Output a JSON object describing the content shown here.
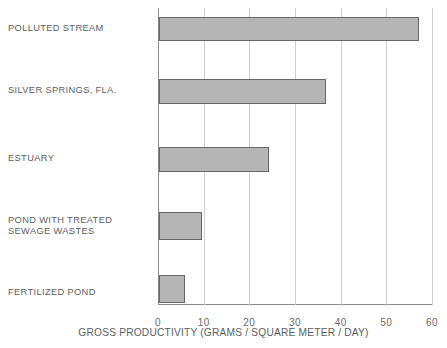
{
  "chart_data": {
    "type": "bar",
    "orientation": "horizontal",
    "title": "",
    "subtitle": "",
    "xlabel": "GROSS PRODUCTIVITY (GRAMS / SQUARE METER / DAY)",
    "ylabel": "",
    "xlim": [
      0,
      60
    ],
    "xticks": [
      0,
      10,
      20,
      30,
      40,
      50,
      60
    ],
    "xtick_labels": [
      "0",
      "10",
      "20",
      "30",
      "40",
      "50",
      "60"
    ],
    "grid": "vertical",
    "legend": "none",
    "categories": [
      "POLLUTED STREAM",
      "SILVER SPRINGS, FLA.",
      "ESTUARY",
      "POND WITH TREATED\nSEWAGE WASTES",
      "FERTILIZED POND"
    ],
    "values": [
      57,
      36.5,
      24,
      9.5,
      5.7
    ],
    "bar_color": "#b5b5b5",
    "bar_border_color": "#666666",
    "gridline_color": "#cfcfcf",
    "axis_color": "#8c8c8c",
    "text_color": "#5d5d5d"
  },
  "labels": {
    "cat0": "POLLUTED STREAM",
    "cat1": "SILVER SPRINGS, FLA.",
    "cat2": "ESTUARY",
    "cat3": "POND WITH TREATED\nSEWAGE WASTES",
    "cat4": "FERTILIZED POND"
  },
  "ticks": {
    "t0": "0",
    "t1": "10",
    "t2": "20",
    "t3": "30",
    "t4": "40",
    "t5": "50",
    "t6": "60"
  },
  "axis": {
    "x_title": "GROSS PRODUCTIVITY (GRAMS / SQUARE METER / DAY)"
  }
}
